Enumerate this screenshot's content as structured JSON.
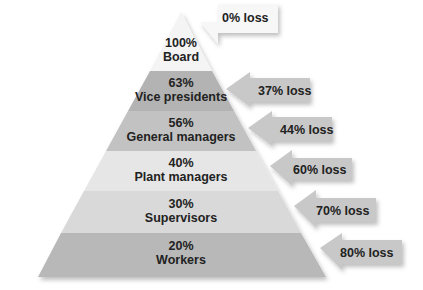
{
  "diagram": {
    "type": "pyramid",
    "levels": [
      {
        "percent": "100%",
        "role": "Board",
        "loss": "0% loss",
        "color": "#f4f4f4"
      },
      {
        "percent": "63%",
        "role": "Vice presidents",
        "loss": "37% loss",
        "color": "#b3b3b3"
      },
      {
        "percent": "56%",
        "role": "General managers",
        "loss": "44% loss",
        "color": "#c2c2c2"
      },
      {
        "percent": "40%",
        "role": "Plant managers",
        "loss": "60% loss",
        "color": "#e6e6e6"
      },
      {
        "percent": "30%",
        "role": "Supervisors",
        "loss": "70% loss",
        "color": "#d9d9d9"
      },
      {
        "percent": "20%",
        "role": "Workers",
        "loss": "80% loss",
        "color": "#b8b8b8"
      }
    ],
    "arrow_color": "#c8c8c8",
    "board_box_color": "#f7f7f7"
  }
}
